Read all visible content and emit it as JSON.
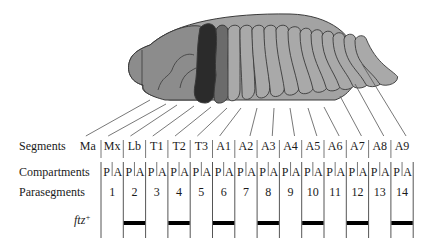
{
  "figure": {
    "type": "embryo-segmentation-diagram",
    "colors": {
      "head": "#8c8c8c",
      "body_back": "#a3a3a3",
      "segment_dark": "#2b2b2b",
      "segment_medium": "#6b6b6b",
      "segment_light": "#a9a9a9",
      "outline": "#3a3a3a",
      "bar": "#000000",
      "line": "#555555"
    }
  },
  "rows": {
    "segments_label": "Segments",
    "compartments_label": "Compartments",
    "parasegments_label": "Parasegments",
    "ftz_label": "ftz",
    "ftz_sup": "+"
  },
  "segments": [
    "Ma",
    "Mx",
    "Lb",
    "T1",
    "T2",
    "T3",
    "A1",
    "A2",
    "A3",
    "A4",
    "A5",
    "A6",
    "A7",
    "A8",
    "A9"
  ],
  "compartments": [
    "P",
    "A",
    "P",
    "A",
    "P",
    "A",
    "P",
    "A",
    "P",
    "A",
    "P",
    "A",
    "P",
    "A",
    "P",
    "A",
    "P",
    "A",
    "P",
    "A",
    "P",
    "A",
    "P",
    "A",
    "P",
    "A",
    "P",
    "A"
  ],
  "parasegments": [
    "1",
    "2",
    "3",
    "4",
    "5",
    "6",
    "7",
    "8",
    "9",
    "10",
    "11",
    "12",
    "13",
    "14"
  ],
  "ftz_expression": {
    "expressed_parasegments": [
      2,
      4,
      6,
      8,
      10,
      12,
      14
    ]
  }
}
